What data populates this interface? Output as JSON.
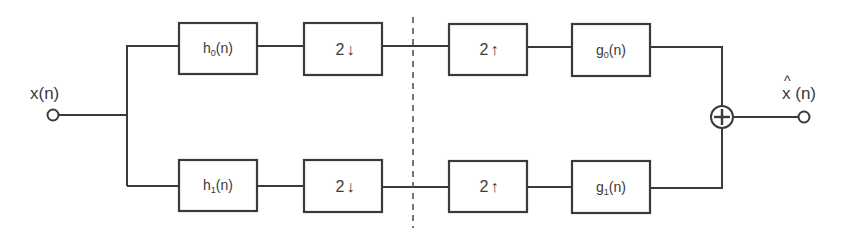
{
  "diagram": {
    "type": "two-channel filter bank (analysis / synthesis)",
    "input": {
      "label": "x(n)"
    },
    "output": {
      "label_hat": "^",
      "label_base": "x",
      "label_arg": " (n)"
    },
    "branches": [
      {
        "name": "top",
        "analysis_filter": {
          "base": "h",
          "sub": "0",
          "arg": "(n)"
        },
        "downsampler": {
          "factor": "2",
          "arrow": "↓"
        },
        "upsampler": {
          "factor": "2",
          "arrow": "↑"
        },
        "synthesis_filter": {
          "base": "g",
          "sub": "0",
          "arg": "(n)"
        }
      },
      {
        "name": "bottom",
        "analysis_filter": {
          "base": "h",
          "sub": "1",
          "arg": "(n)"
        },
        "downsampler": {
          "factor": "2",
          "arrow": "↓"
        },
        "upsampler": {
          "factor": "2",
          "arrow": "↑"
        },
        "synthesis_filter": {
          "base": "g",
          "sub": "1",
          "arg": "(n)"
        }
      }
    ],
    "summing_junction": {
      "symbol": "+"
    },
    "divider": {
      "style": "dashed"
    },
    "colors": {
      "stroke": "#3a3a3a",
      "background": "#ffffff"
    }
  }
}
